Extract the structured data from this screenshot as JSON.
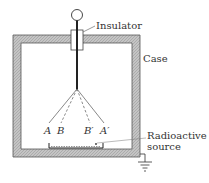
{
  "diagram": {
    "labels": {
      "insulator": "Insulator",
      "case": "Case",
      "radioactive_source_line1": "Radioactive",
      "radioactive_source_line2": "source",
      "leaf_a": "A",
      "leaf_b": "B",
      "leaf_b_prime": "B′",
      "leaf_a_prime": "A′"
    },
    "colors": {
      "case_fill": "#b8b8b8",
      "line": "#333333",
      "background": "#ffffff"
    }
  }
}
